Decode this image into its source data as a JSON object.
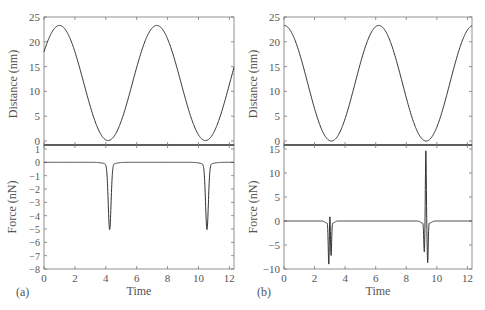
{
  "chart_data": [
    {
      "panel": "(a)",
      "type": "line",
      "xlabel": "Time",
      "xlim": [
        0,
        12.3
      ],
      "xticks": [
        0,
        2,
        4,
        6,
        8,
        10,
        12
      ],
      "subplots": [
        {
          "ylabel": "Distance (nm)",
          "ylim": [
            -0.8,
            25
          ],
          "yticks": [
            0,
            5,
            10,
            15,
            20,
            25
          ],
          "series": [
            {
              "name": "distance",
              "description": "sinusoid, amplitude ~11.6, mean ~11.7, period ~6.3, max ~23.3 at t~1.0 and ~7.3, min ~0.1 at t~4.2 and ~10.5, starts ~17 at t=0, ends ~10 at t=12.3"
            }
          ]
        },
        {
          "ylabel": "Force (nN)",
          "ylim": [
            -8,
            1
          ],
          "yticks": [
            1,
            0,
            -1,
            -2,
            -3,
            -4,
            -5,
            -6,
            -7,
            -8
          ],
          "series": [
            {
              "name": "force",
              "description": "zero baseline with narrow negative dips to ~-4.9 at t~4.25 and t~10.55"
            }
          ]
        }
      ]
    },
    {
      "panel": "(b)",
      "type": "line",
      "xlabel": "Time",
      "xlim": [
        0,
        12.3
      ],
      "xticks": [
        0,
        2,
        4,
        6,
        8,
        10,
        12
      ],
      "subplots": [
        {
          "ylabel": "Distance (nm)",
          "ylim": [
            -0.8,
            25
          ],
          "yticks": [
            0,
            5,
            10,
            15,
            20,
            25
          ],
          "series": [
            {
              "name": "distance",
              "description": "sinusoid, max ~23.3 at t~0 and ~6.2, min ~0 at t~3.05 and ~9.3, ends ~22 at t=12.3"
            }
          ]
        },
        {
          "ylabel": "Force (nN)",
          "ylim": [
            -10,
            15
          ],
          "yticks": [
            -10,
            -5,
            0,
            5,
            10,
            15
          ],
          "series": [
            {
              "name": "force",
              "description": "zero baseline; near t~3.0: dip to ~-8.8, spike to ~2.7, dip to ~-7; near t~9.3: dip to ~-6.3, spike to ~15, dip to ~-8.5"
            }
          ]
        }
      ]
    }
  ],
  "labels": {
    "panel_a": "(a)",
    "panel_b": "(b)",
    "xlabel": "Time",
    "ylabel_distance": "Distance (nm)",
    "ylabel_force": "Force (nN)"
  }
}
